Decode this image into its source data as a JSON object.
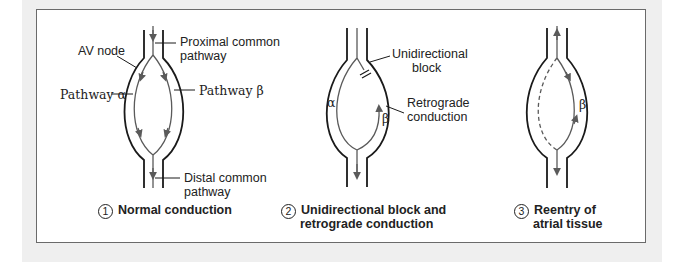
{
  "colors": {
    "outline": "#1a1a1a",
    "pathway": "#5a5a5a",
    "frame_border": "#6a6a6a",
    "background": "#efefef"
  },
  "panel1": {
    "labels": {
      "av_node": "AV node",
      "proximal_line1": "Proximal common",
      "proximal_line2": "pathway",
      "pathway_alpha": "Pathway α",
      "pathway_beta": "Pathway β",
      "distal_line1": "Distal common",
      "distal_line2": "pathway"
    },
    "caption_number": "1",
    "caption": "Normal conduction"
  },
  "panel2": {
    "labels": {
      "block_line1": "Unidirectional",
      "block_line2": "block",
      "retro_line1": "Retrograde",
      "retro_line2": "conduction",
      "alpha": "α",
      "beta": "β"
    },
    "caption_number": "2",
    "caption_line1": "Unidirectional block and",
    "caption_line2": "retrograde conduction"
  },
  "panel3": {
    "labels": {
      "beta": "β"
    },
    "caption_number": "3",
    "caption_line1": "Reentry of",
    "caption_line2": "atrial tissue"
  }
}
